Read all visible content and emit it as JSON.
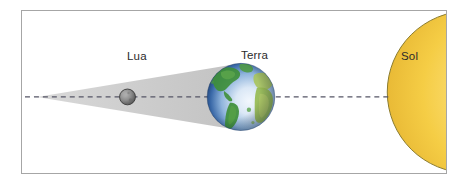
{
  "figure": {
    "language": "pt",
    "background_color": "#ffffff",
    "frame_border_color": "#a6a6a6"
  },
  "labels": {
    "moon": "Lua",
    "earth": "Terra",
    "sun": "Sol"
  },
  "bodies": {
    "sun": {
      "name": "Sol",
      "shape": "semicircle",
      "color_core": "#fbe08a",
      "color_mid": "#f6cf48",
      "color_edge": "#e8b93a",
      "outline_color": "#8a7a2e",
      "center_x": 470,
      "center_y": 92,
      "radius": 82
    },
    "earth": {
      "name": "Terra",
      "shape": "sphere",
      "ocean_color": "#2d5f9e",
      "ocean_highlight": "#eaf2fb",
      "land_color": "#3f8f3a",
      "land_light_color": "#a8c45c",
      "center_x": 241,
      "center_y": 97,
      "radius": 34
    },
    "moon": {
      "name": "Lua",
      "shape": "sphere",
      "color_light": "#9a9a9a",
      "color_dark": "#4e4e4e",
      "outline_color": "#3a3a3a",
      "center_x": 127,
      "center_y": 97,
      "radius": 8
    }
  },
  "shadow_cone": {
    "name": "Cone de sombra da Terra",
    "fill_color": "#c9c9c9",
    "apex_x": 36,
    "apex_y": 97,
    "base_x": 241,
    "base_top_y": 63,
    "base_bottom_y": 131
  },
  "axis_line": {
    "name": "Linha de alinhamento Sol-Terra-Lua",
    "style": "dashed",
    "color": "#555566",
    "y": 97,
    "x_start": 24,
    "x_end": 392
  }
}
